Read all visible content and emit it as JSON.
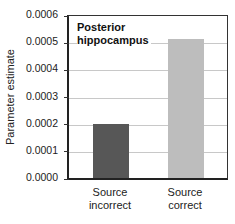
{
  "chart_data": {
    "type": "bar",
    "title": "Posterior hippocampus",
    "title_lines": [
      "Posterior",
      "hippocampus"
    ],
    "xlabel": "",
    "ylabel": "Parameter estimate",
    "categories": [
      "Source incorrect",
      "Source correct"
    ],
    "category_lines": [
      [
        "Source",
        "incorrect"
      ],
      [
        "Source",
        "correct"
      ]
    ],
    "values": [
      0.0002,
      0.00051
    ],
    "colors": [
      "#575757",
      "#bdbdbd"
    ],
    "ylim": [
      0.0,
      0.0006
    ],
    "yticks": [
      "0.0000",
      "0.0001",
      "0.0002",
      "0.0003",
      "0.0004",
      "0.0005",
      "0.0006"
    ],
    "grid": true,
    "legend": null
  }
}
